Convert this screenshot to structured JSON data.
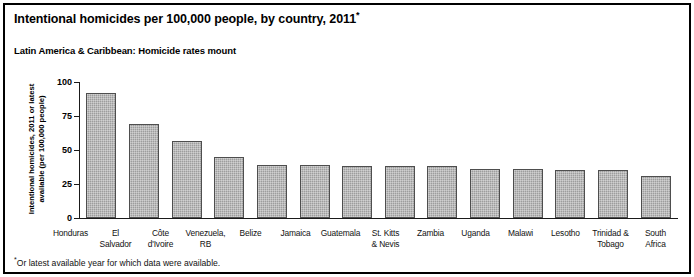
{
  "header": {
    "title": "Intentional homicides per 100,000 people, by country, 2011",
    "title_marker": "*",
    "subtitle": "Latin America & Caribbean: Homicide rates mount"
  },
  "footnote": {
    "marker": "*",
    "text": "Or latest available year for which data were available."
  },
  "chart_data": {
    "type": "bar",
    "title": "Intentional homicides per 100,000 people, by country, 2011*",
    "subtitle": "Latin America & Caribbean: Homicide rates mount",
    "xlabel": "",
    "ylabel": "Intentional homicides, 2011 or latest available (per 100,000 people)",
    "ylabel_lines": [
      "Intentional homicides, 2011 or latest",
      "available (per 100,000 people)"
    ],
    "ylim": [
      0,
      100
    ],
    "yticks": [
      0,
      25,
      50,
      75,
      100
    ],
    "ytick_labels": [
      "0",
      "25",
      "50",
      "75",
      "100"
    ],
    "grid": false,
    "legend": false,
    "bar_color": "#9d9d9d",
    "bar_border_color": "#4e4e4e",
    "categories": [
      "Honduras",
      "El Salvador",
      "Côte d'Ivoire",
      "Venezuela, RB",
      "Belize",
      "Jamaica",
      "Guatemala",
      "St. Kitts & Nevis",
      "Zambia",
      "Uganda",
      "Malawi",
      "Lesotho",
      "Trinidad & Tobago",
      "South Africa"
    ],
    "category_label_lines": [
      [
        "Honduras"
      ],
      [
        "El",
        "Salvador"
      ],
      [
        "Côte",
        "d'Ivoire"
      ],
      [
        "Venezuela,",
        "RB"
      ],
      [
        "Belize"
      ],
      [
        "Jamaica"
      ],
      [
        "Guatemala"
      ],
      [
        "St. Kitts",
        "& Nevis"
      ],
      [
        "Zambia"
      ],
      [
        "Uganda"
      ],
      [
        "Malawi"
      ],
      [
        "Lesotho"
      ],
      [
        "Trinidad &",
        "Tobago"
      ],
      [
        "South",
        "Africa"
      ]
    ],
    "values": [
      91.6,
      69.2,
      56.9,
      45.1,
      39.3,
      39.3,
      38.5,
      38.2,
      38.0,
      36.3,
      36.0,
      35.2,
      35.2,
      31.0
    ]
  }
}
